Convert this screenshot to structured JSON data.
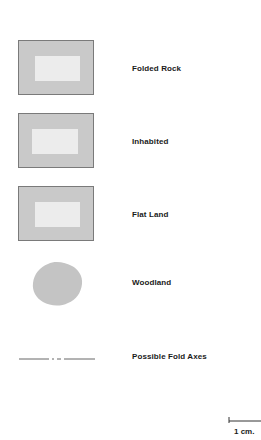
{
  "legend": {
    "items": [
      {
        "label": "Folded Rock",
        "symbol": "shaded-rectangle-with-light-center"
      },
      {
        "label": "Inhabited",
        "symbol": "shaded-rectangle-with-light-center"
      },
      {
        "label": "Flat Land",
        "symbol": "shaded-rectangle-with-light-center"
      },
      {
        "label": "Woodland",
        "symbol": "gray-blob"
      },
      {
        "label": "Possible Fold Axes",
        "symbol": "dash-dot-line"
      }
    ]
  },
  "scale_bar": {
    "label": "1 cm."
  },
  "colors": {
    "fill": "#c9c9c9",
    "inner": "#ececec",
    "border": "#7a7a7a",
    "line": "#555555"
  }
}
